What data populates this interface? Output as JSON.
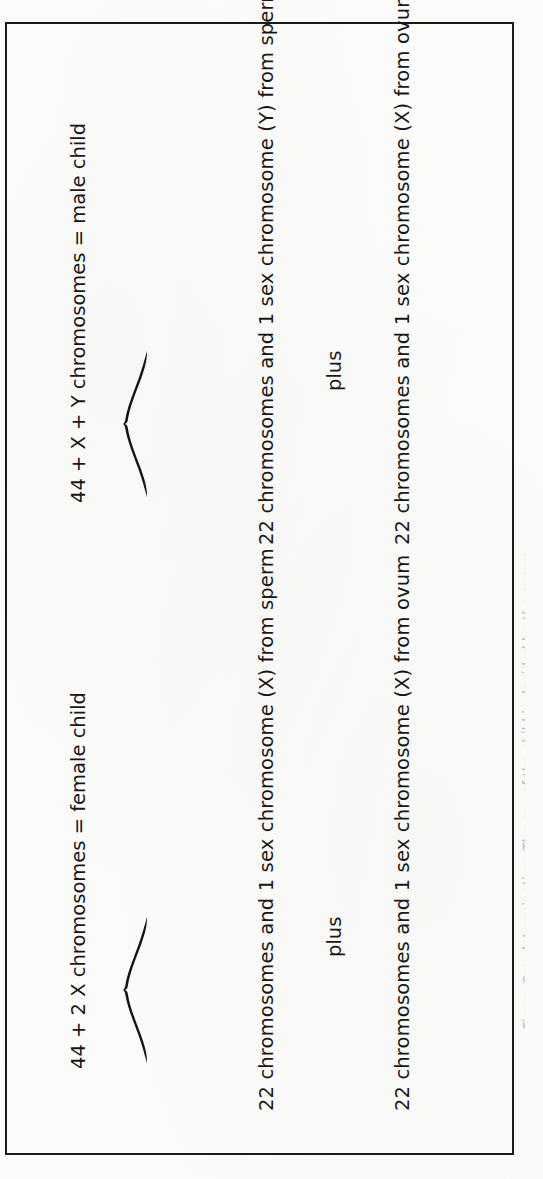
{
  "figure": {
    "orientation": "rotated-90-ccw",
    "box_border_color": "#1b1b1b",
    "background_color": "#fdfdfc",
    "text_color": "#171717",
    "groups": [
      {
        "id": "female-child",
        "ovum_line": "22 chromosomes and 1 sex chromosome  (X)  from ovum",
        "connector": "plus",
        "sperm_line": "22 chromosomes and 1 sex chromosome  (X)  from sperm",
        "brace": "brace-up",
        "result_line": "44 + 2 X chromosomes  =  female child"
      },
      {
        "id": "male-child",
        "ovum_line": "22 chromosomes and 1 sex chromosome  (X)  from ovum",
        "connector": "plus",
        "sperm_line": "22 chromosomes and 1 sex chromosome  (Y)  from sperm",
        "brace": "brace-up",
        "result_line": "44 + X + Y chromosomes  =  male child"
      }
    ]
  },
  "caption": {
    "cut_off_text": "Figure   Sex determination. The sex of the child is decided by the sperm"
  }
}
